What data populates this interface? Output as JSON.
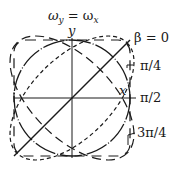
{
  "diagram": {
    "title": "ω",
    "title_sub_y": "y",
    "title_eq": " = ω",
    "title_sub_x": "x",
    "axis_x_label": "x",
    "axis_y_label": "y",
    "curves": [
      {
        "label": "β = 0",
        "shape": "line",
        "style": "solid"
      },
      {
        "label": "π/4",
        "shape": "ellipse",
        "style": "short-dash"
      },
      {
        "label": "π/2",
        "shape": "circle",
        "style": "dash-dot"
      },
      {
        "label": "3π/4",
        "shape": "ellipse",
        "style": "long-dash"
      }
    ],
    "colors": {
      "ink": "#1a1a1a",
      "background": "#ffffff"
    }
  }
}
